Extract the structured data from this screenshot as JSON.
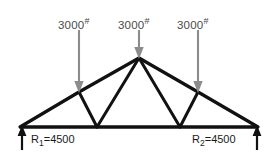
{
  "figure": {
    "type": "truss-free-body-diagram",
    "background_color": "#ffffff",
    "member_color": "#111111",
    "load_arrow_color": "#8c8c8c",
    "reaction_arrow_color": "#111111"
  },
  "loads": [
    {
      "id": "load-left",
      "value": "3000",
      "unit": "#",
      "label_x": 58,
      "label_y": 17,
      "arrow_x": 79,
      "arrow_top": 30,
      "arrow_tip": 92
    },
    {
      "id": "load-center",
      "value": "3000",
      "unit": "#",
      "label_x": 118,
      "label_y": 17,
      "arrow_x": 139,
      "arrow_top": 30,
      "arrow_tip": 58
    },
    {
      "id": "load-right",
      "value": "3000",
      "unit": "#",
      "label_x": 177,
      "label_y": 17,
      "arrow_x": 198,
      "arrow_top": 30,
      "arrow_tip": 92
    }
  ],
  "reactions": [
    {
      "id": "reaction-left",
      "name": "R",
      "index": "1",
      "equals": "=",
      "value": "4500",
      "label_x": 31,
      "label_y": 134,
      "arrow_x": 22,
      "arrow_bottom": 150,
      "arrow_tip": 126
    },
    {
      "id": "reaction-right",
      "name": "R",
      "index": "2",
      "equals": "=",
      "value": "4500",
      "label_x": 192,
      "label_y": 134,
      "arrow_x": 257,
      "arrow_bottom": 150,
      "arrow_tip": 126
    }
  ],
  "geometry": {
    "joints": {
      "left_support": {
        "x": 20,
        "y": 127
      },
      "right_support": {
        "x": 258,
        "y": 127
      },
      "bottom_left": {
        "x": 97,
        "y": 127
      },
      "bottom_right": {
        "x": 180,
        "y": 127
      },
      "top_left": {
        "x": 79,
        "y": 92
      },
      "apex": {
        "x": 139,
        "y": 58
      },
      "top_right": {
        "x": 198,
        "y": 92
      }
    },
    "members": [
      {
        "id": "bottom-chord",
        "from": "left_support",
        "to": "right_support"
      },
      {
        "id": "left-top-chord-low",
        "from": "left_support",
        "to": "top_left"
      },
      {
        "id": "left-top-chord-high",
        "from": "top_left",
        "to": "apex"
      },
      {
        "id": "right-top-chord-high",
        "from": "apex",
        "to": "top_right"
      },
      {
        "id": "right-top-chord-low",
        "from": "top_right",
        "to": "right_support"
      },
      {
        "id": "left-web-vertical",
        "from": "top_left",
        "to": "bottom_left"
      },
      {
        "id": "left-web-diagonal",
        "from": "bottom_left",
        "to": "apex"
      },
      {
        "id": "right-web-diagonal",
        "from": "apex",
        "to": "bottom_right"
      },
      {
        "id": "right-web-vertical",
        "from": "bottom_right",
        "to": "top_right"
      }
    ]
  }
}
